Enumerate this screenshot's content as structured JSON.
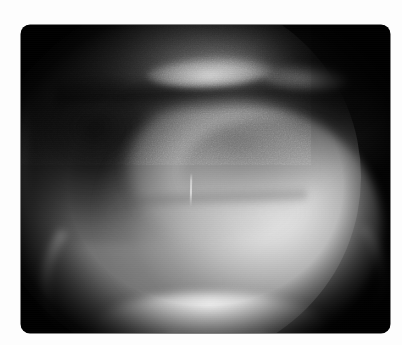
{
  "viewer": {
    "name": "radiograph-viewer",
    "background_color": "#fdfdfd",
    "width_px": 402,
    "height_px": 345
  },
  "frame": {
    "name": "film-frame",
    "border_color": "#050505",
    "corner_radius_px": 9,
    "left_px": 21,
    "top_px": 25,
    "width_px": 369,
    "height_px": 308
  },
  "image": {
    "modality_appearance": "fluoroscopy-grayscale",
    "field_of_view_shape": "circular",
    "colors": {
      "background": "#050505",
      "soft_tissue_mid": "#8a8a8a",
      "bright_organ": "#eeeeee",
      "dark_tissue": "#0c0c0c",
      "rim_highlight": "#fafafa",
      "device": "#e8e8e8"
    },
    "features": [
      {
        "name": "fov-disc",
        "label": "Circular image-intensifier field of view",
        "center_x_px": 154,
        "center_y_px": 152,
        "radius_px": 186
      },
      {
        "name": "organ-mass",
        "label": "Bright contrast-filled organ mass",
        "center_x_px": 212,
        "center_y_px": 203
      },
      {
        "name": "organ-lobe",
        "label": "Secondary brightness lobe",
        "center_x_px": 198,
        "center_y_px": 142
      },
      {
        "name": "dark-tissue-left",
        "label": "Dark mottled soft tissue, upper-left quadrant",
        "center_x_px": 111,
        "center_y_px": 111
      },
      {
        "name": "dark-tissue-right",
        "label": "Dark mottled soft tissue, upper-right quadrant",
        "center_x_px": 294,
        "center_y_px": 77
      },
      {
        "name": "gas-band",
        "label": "Dark horizontal gas / diaphragm interface band",
        "center_y_px": 68
      },
      {
        "name": "air-crescent",
        "label": "Bright air-fluid crescent",
        "center_x_px": 188,
        "center_y_px": 47
      },
      {
        "name": "tissue-fold",
        "label": "Dark curved tissue fold",
        "center_x_px": 255,
        "center_y_px": 152
      },
      {
        "name": "device-line",
        "label": "Thin radiopaque linear device",
        "x_px": 169,
        "top_y_px": 148,
        "length_px": 34
      },
      {
        "name": "rim-lower-left",
        "label": "Bright collimation rim arc, lower left"
      },
      {
        "name": "rim-lower-right",
        "label": "Bright collimation rim arc, lower right"
      },
      {
        "name": "bottom-lip",
        "label": "Bright clipped lower edge of the disc"
      }
    ]
  }
}
